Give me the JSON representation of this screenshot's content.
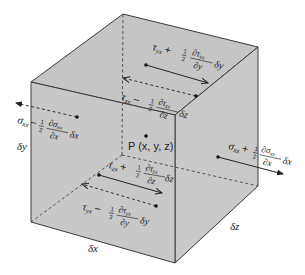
{
  "diagram": {
    "colors": {
      "face_front": "#c8c8c8",
      "face_top": "#c4c4c4",
      "face_right": "#c9c9c9",
      "edge": "#3a3a3a",
      "text": "#222222",
      "background": "#ffffff"
    },
    "point_label": "P (x, y, z)",
    "dimensions": {
      "dx": "δx",
      "dy": "δy",
      "dz": "δz"
    },
    "stresses": {
      "top_yx_plus": {
        "sym": "τ",
        "sub": "yx",
        "op": "+",
        "half": "1/2",
        "num": "∂τ",
        "num_sub": "yx",
        "den": "∂y",
        "tail": "δy"
      },
      "back_zx_minus": {
        "sym": "τ",
        "sub": "zx",
        "op": "−",
        "half": "1/2",
        "num": "∂τ",
        "num_sub": "zx",
        "den": "∂z",
        "tail": "δz"
      },
      "left_xx_minus": {
        "sym": "σ",
        "sub": "xx",
        "op": "−",
        "half": "1/2",
        "num": "∂σ",
        "num_sub": "xx",
        "den": "∂x",
        "tail": "δx"
      },
      "right_xx_plus": {
        "sym": "σ",
        "sub": "xx",
        "op": "+",
        "half": "1/2",
        "num": "∂σ",
        "num_sub": "xx",
        "den": "∂x",
        "tail": "δx"
      },
      "front_zx_plus": {
        "sym": "τ",
        "sub": "zx",
        "op": "+",
        "half": "1/2",
        "num": "∂τ",
        "num_sub": "zx",
        "den": "∂z",
        "tail": "δz"
      },
      "bottom_yx_minus": {
        "sym": "τ",
        "sub": "yx",
        "op": "−",
        "half": "1/2",
        "num": "∂τ",
        "num_sub": "yx",
        "den": "∂y",
        "tail": "δy"
      }
    }
  }
}
